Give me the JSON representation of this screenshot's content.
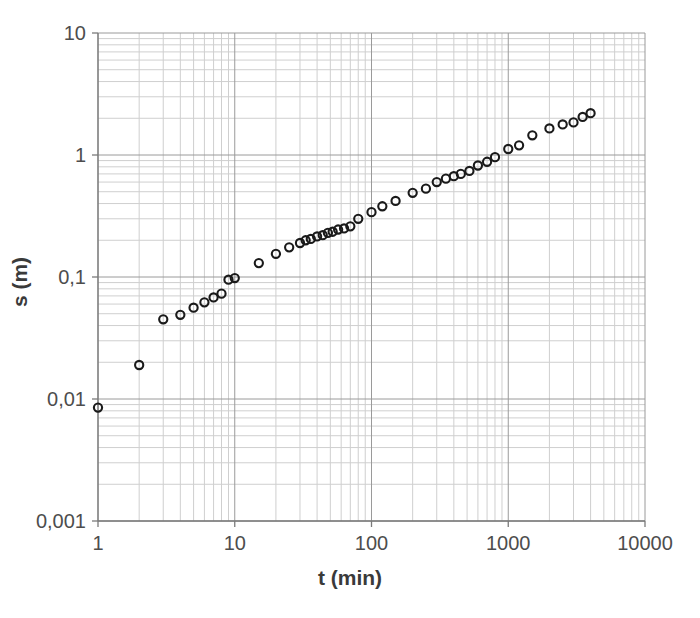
{
  "chart_data": {
    "type": "scatter",
    "title": "",
    "xlabel": "t (min)",
    "ylabel": "s (m)",
    "xscale": "log",
    "yscale": "log",
    "xlim": [
      1,
      10000
    ],
    "ylim": [
      0.001,
      10
    ],
    "grid": true,
    "minor_grid": true,
    "legend": "none",
    "marker": "open-circle",
    "marker_color": "#1a1a1a",
    "grid_color": "#9a9a9a",
    "minor_grid_color": "#cfcfcf",
    "axis_color": "#7a7a7a",
    "xticks": [
      1,
      10,
      100,
      1000,
      10000
    ],
    "xtick_labels": [
      "1",
      "10",
      "100",
      "1000",
      "10000"
    ],
    "yticks": [
      0.001,
      0.01,
      0.1,
      1,
      10
    ],
    "ytick_labels": [
      "0,001",
      "0,01",
      "0,1",
      "1",
      "10"
    ],
    "x": [
      1,
      2,
      3,
      4,
      5,
      6,
      7,
      8,
      9,
      10,
      15,
      20,
      25,
      30,
      33,
      36,
      40,
      44,
      48,
      52,
      57,
      63,
      70,
      80,
      100,
      120,
      150,
      200,
      250,
      300,
      350,
      400,
      450,
      520,
      600,
      700,
      800,
      1000,
      1200,
      1500,
      2000,
      2500,
      3000,
      3500,
      4000
    ],
    "y": [
      0.0085,
      0.019,
      0.045,
      0.049,
      0.056,
      0.062,
      0.068,
      0.073,
      0.095,
      0.098,
      0.13,
      0.155,
      0.175,
      0.19,
      0.2,
      0.205,
      0.215,
      0.22,
      0.23,
      0.235,
      0.245,
      0.25,
      0.26,
      0.3,
      0.34,
      0.38,
      0.42,
      0.49,
      0.53,
      0.6,
      0.64,
      0.67,
      0.7,
      0.74,
      0.82,
      0.88,
      0.96,
      1.12,
      1.2,
      1.45,
      1.65,
      1.78,
      1.85,
      2.05,
      2.2
    ]
  },
  "axes": {
    "x_title": "t (min)",
    "y_title": "s (m)"
  },
  "ticks": {
    "x": [
      {
        "value": 1,
        "label": "1"
      },
      {
        "value": 10,
        "label": "10"
      },
      {
        "value": 100,
        "label": "100"
      },
      {
        "value": 1000,
        "label": "1000"
      },
      {
        "value": 10000,
        "label": "10000"
      }
    ],
    "y": [
      {
        "value": 10,
        "label": "10"
      },
      {
        "value": 1,
        "label": "1"
      },
      {
        "value": 0.1,
        "label": "0,1"
      },
      {
        "value": 0.01,
        "label": "0,01"
      },
      {
        "value": 0.001,
        "label": "0,001"
      }
    ]
  }
}
